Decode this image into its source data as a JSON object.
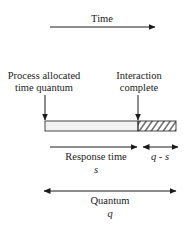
{
  "diagram": {
    "time_label": "Time",
    "start_label_line1": "Process allocated",
    "start_label_line2": "time quantum",
    "end_label_line1": "Interaction",
    "end_label_line2": "complete",
    "response_label": "Response time",
    "response_symbol": "s",
    "remainder_symbol": "q - s",
    "quantum_label": "Quantum",
    "quantum_symbol": "q"
  },
  "colors": {
    "ink": "#1a1a1a",
    "bar_fill": "#f2f2f2"
  }
}
